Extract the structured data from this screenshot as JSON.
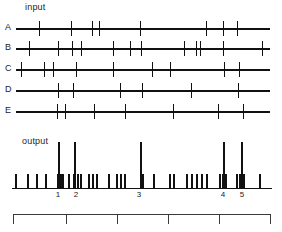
{
  "figure": {
    "input_label": "input",
    "output_label": "output",
    "ink_color": "#111111",
    "background": "#ffffff"
  },
  "chart_data": {
    "type": "scatter",
    "title": "",
    "subtitle": "",
    "xlabel": "",
    "ylabel": "",
    "xlim": [
      0,
      282
    ],
    "grid": false,
    "legend": null,
    "panels": [
      {
        "name": "input",
        "label": "input",
        "rows": [
          {
            "label": "A",
            "y": 28,
            "spikes": [
              39,
              71,
              92,
              99,
              140,
              206,
              223,
              237
            ]
          },
          {
            "label": "B",
            "y": 48,
            "spikes": [
              29,
              58,
              72,
              81,
              113,
              130,
              141,
              184,
              196,
              200,
              223,
              262
            ]
          },
          {
            "label": "C",
            "y": 69,
            "spikes": [
              21,
              44,
              53,
              76,
              113,
              152,
              170,
              224,
              239
            ]
          },
          {
            "label": "D",
            "y": 90,
            "spikes": [
              58,
              73,
              120,
              142,
              191,
              238
            ]
          },
          {
            "label": "E",
            "y": 111,
            "spikes": [
              57,
              65,
              94,
              125,
              173,
              218,
              243
            ]
          }
        ]
      },
      {
        "name": "output",
        "label": "output",
        "baseline_y": 188,
        "tall_spikes": [
          58,
          74,
          140,
          223,
          241
        ],
        "short_spikes": [
          15,
          27,
          36,
          45,
          57,
          60,
          62,
          68,
          73,
          77,
          80,
          88,
          92,
          96,
          108,
          116,
          120,
          124,
          140,
          142,
          153,
          169,
          173,
          186,
          191,
          196,
          201,
          206,
          219,
          222,
          225,
          236,
          239,
          243,
          259
        ]
      }
    ],
    "x_axis": {
      "tick_labels": [
        "1",
        "2",
        "3",
        "4",
        "5"
      ],
      "tick_positions": [
        58,
        76,
        139,
        223,
        242
      ]
    },
    "scale_bar": {
      "x_start": 13,
      "x_end": 270,
      "tick_positions": [
        13,
        66,
        117,
        168,
        219,
        270
      ]
    }
  }
}
